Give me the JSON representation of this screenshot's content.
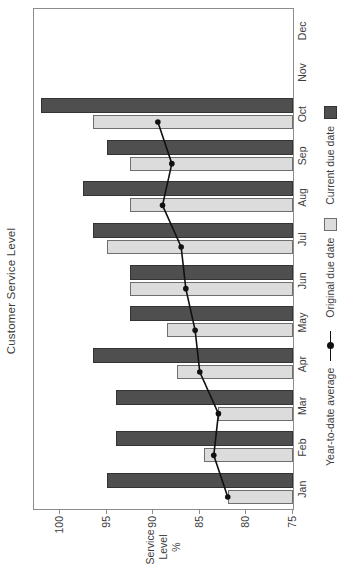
{
  "chart_data": {
    "type": "bar",
    "orientation": "landscape-rotated-90ccw",
    "title": "Customer Service Level",
    "categories": [
      "Jan",
      "Feb",
      "Mar",
      "Apr",
      "May",
      "Jun",
      "Jul",
      "Aug",
      "Sep",
      "Oct",
      "Nov",
      "Dec"
    ],
    "series": [
      {
        "name": "Original due date",
        "type": "bar",
        "fill": "#dcdcdc",
        "border": "#6e6e6e",
        "values": [
          82,
          84.5,
          83,
          87.5,
          88.5,
          92.5,
          95,
          92.5,
          92.5,
          96.5,
          null,
          null
        ]
      },
      {
        "name": "Current due date",
        "type": "bar",
        "fill": "#4f4f4f",
        "border": "#333333",
        "values": [
          95,
          94,
          94,
          96.5,
          92.5,
          92.5,
          96.5,
          97.5,
          95,
          102,
          null,
          null
        ]
      },
      {
        "name": "Year-to-date average",
        "type": "line",
        "color": "#111111",
        "values": [
          82,
          83.5,
          83,
          85,
          85.5,
          86.5,
          87,
          89,
          88,
          89.5,
          null,
          null
        ]
      }
    ],
    "value_axis": {
      "title_lines": [
        "Service",
        "Level",
        "%"
      ],
      "min": 75,
      "plot_top_value": 102.8,
      "ticks": [
        "100",
        "95",
        "90",
        "85",
        "80",
        "75"
      ],
      "tick_values": [
        100,
        95,
        90,
        85,
        80,
        75
      ]
    },
    "grid": false,
    "legend_position": "below-axis",
    "plot_border_color": "#8c8c8c",
    "text_color": "#3d3d3d"
  },
  "legend": {
    "line_label": "Year-to-date average",
    "original_label": "Original due date",
    "current_label": "Current due date"
  }
}
